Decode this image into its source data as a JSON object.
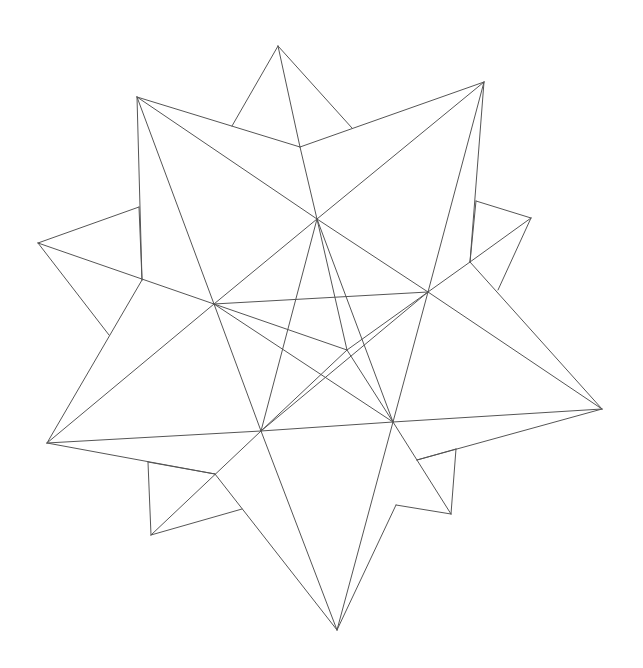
{
  "figure": {
    "title": "",
    "stroke_color": "#555555",
    "background": "#ffffff"
  },
  "vertices": {
    "top": [
      278,
      46
    ],
    "top_left": [
      137,
      97
    ],
    "top_right": [
      484,
      82
    ],
    "left": [
      38,
      243
    ],
    "right_spike": [
      531,
      218
    ],
    "right": [
      602,
      409
    ],
    "bottom_left": [
      47,
      443
    ],
    "bottom": [
      337,
      630
    ],
    "bl_small": [
      151,
      535
    ],
    "br_small": [
      451,
      514
    ],
    "top_mid": [
      300,
      147
    ],
    "tl_a": [
      232,
      126
    ],
    "tr_a": [
      352,
      128
    ],
    "r_a": [
      476,
      201
    ],
    "r_b": [
      470,
      262
    ],
    "r_c": [
      498,
      290
    ],
    "l_a": [
      139,
      207
    ],
    "l_b": [
      142,
      280
    ],
    "l_c": [
      109,
      335
    ],
    "bl_a": [
      148,
      462
    ],
    "bl_b": [
      215,
      474
    ],
    "bl_c": [
      242,
      509
    ],
    "br_a": [
      417,
      460
    ],
    "br_b": [
      456,
      449
    ],
    "br_c": [
      396,
      505
    ],
    "pA": [
      317,
      219
    ],
    "pB": [
      428,
      292
    ],
    "pC": [
      393,
      422
    ],
    "pD": [
      261,
      431
    ],
    "pE": [
      214,
      304
    ],
    "center": [
      347,
      350
    ]
  },
  "edges": [
    [
      "top",
      "top_mid"
    ],
    [
      "top",
      "tl_a"
    ],
    [
      "top",
      "tr_a"
    ],
    [
      "top_left",
      "top_mid"
    ],
    [
      "top_mid",
      "top_right"
    ],
    [
      "top_left",
      "pA"
    ],
    [
      "top_left",
      "pE"
    ],
    [
      "top_left",
      "l_b"
    ],
    [
      "top_right",
      "pA"
    ],
    [
      "top_right",
      "pB"
    ],
    [
      "top_right",
      "r_b"
    ],
    [
      "left",
      "l_a"
    ],
    [
      "left",
      "pE"
    ],
    [
      "left",
      "l_c"
    ],
    [
      "l_a",
      "l_b"
    ],
    [
      "l_b",
      "bottom_left"
    ],
    [
      "right_spike",
      "r_a"
    ],
    [
      "right_spike",
      "r_b"
    ],
    [
      "right_spike",
      "r_c"
    ],
    [
      "r_a",
      "r_b"
    ],
    [
      "r_b",
      "pB"
    ],
    [
      "r_b",
      "right"
    ],
    [
      "right",
      "pB"
    ],
    [
      "right",
      "pC"
    ],
    [
      "right",
      "br_a"
    ],
    [
      "bottom_left",
      "pE"
    ],
    [
      "bottom_left",
      "pD"
    ],
    [
      "bottom_left",
      "bl_b"
    ],
    [
      "bl_a",
      "bl_b"
    ],
    [
      "bl_a",
      "bl_small"
    ],
    [
      "bl_small",
      "bl_c"
    ],
    [
      "bl_small",
      "pD"
    ],
    [
      "bl_b",
      "bottom"
    ],
    [
      "bottom",
      "pD"
    ],
    [
      "bottom",
      "pC"
    ],
    [
      "bottom",
      "br_c"
    ],
    [
      "br_a",
      "br_b"
    ],
    [
      "br_b",
      "br_small"
    ],
    [
      "br_small",
      "pC"
    ],
    [
      "br_c",
      "br_small"
    ],
    [
      "pA",
      "pB"
    ],
    [
      "pB",
      "pC"
    ],
    [
      "pC",
      "pD"
    ],
    [
      "pD",
      "pE"
    ],
    [
      "pE",
      "pA"
    ],
    [
      "pA",
      "center"
    ],
    [
      "pB",
      "center"
    ],
    [
      "pC",
      "center"
    ],
    [
      "pD",
      "center"
    ],
    [
      "pE",
      "center"
    ],
    [
      "pA",
      "top_mid"
    ],
    [
      "pE",
      "pB"
    ],
    [
      "pA",
      "pC"
    ],
    [
      "pB",
      "pD"
    ],
    [
      "pC",
      "pE"
    ],
    [
      "pD",
      "pA"
    ]
  ]
}
